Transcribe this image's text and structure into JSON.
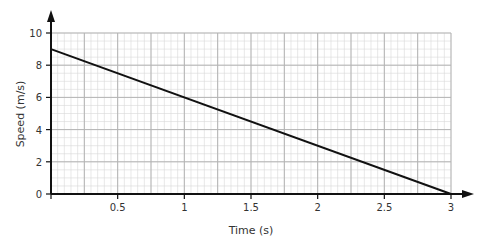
{
  "chart_data": {
    "type": "line",
    "title": "",
    "xlabel": "Time (s)",
    "ylabel": "Speed (m/s)",
    "xlim": [
      0,
      3
    ],
    "ylim": [
      0,
      10
    ],
    "x_ticks": [
      "0.5",
      "1",
      "1.5",
      "2",
      "2.5",
      "3"
    ],
    "y_ticks": [
      "0",
      "2",
      "4",
      "6",
      "8",
      "10"
    ],
    "grid": true,
    "legend": null,
    "series": [
      {
        "name": "speed",
        "x": [
          0,
          3
        ],
        "values": [
          9,
          0
        ]
      }
    ]
  }
}
